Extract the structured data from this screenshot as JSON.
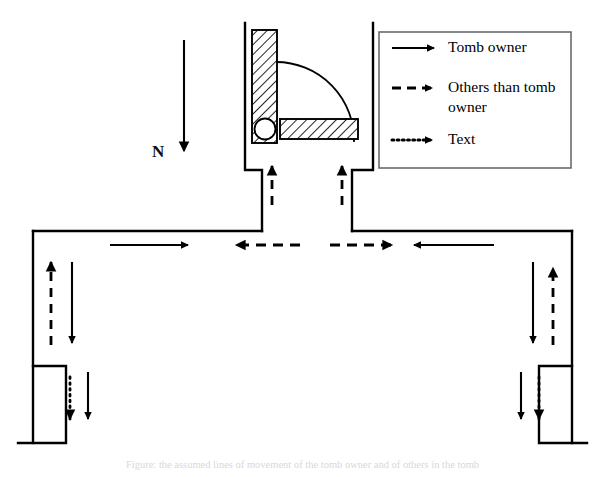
{
  "figure": {
    "background_color": "#ffffff",
    "line_color": "#000000",
    "caption": "Figure: the assumed lines of movement of the tomb owner and of others in the tomb"
  },
  "compass": {
    "label": "N",
    "direction": "down",
    "arrow_name": "north-arrow"
  },
  "legend": {
    "box_color": "#6b6b6b",
    "items": [
      {
        "id": "tomb-owner",
        "label": "Tomb owner",
        "line_style": "solid",
        "marker": "arrow-right"
      },
      {
        "id": "others-than-tomb-owner",
        "label": "Others than tomb owner",
        "label_line_1": "Others than tomb",
        "label_line_2": "owner",
        "line_style": "dashed",
        "marker": "arrow-right"
      },
      {
        "id": "text",
        "label": "Text",
        "line_style": "dotted",
        "marker": "arrow-right"
      }
    ]
  },
  "plan": {
    "shrine": {
      "name": "hatched-shrine-block",
      "fill": "hatch",
      "elements": [
        "vertical-jamb",
        "horizontal-lintel",
        "round-pivot",
        "door-swing-arc"
      ]
    },
    "chambers": [
      {
        "id": "left-chamber",
        "side": "left"
      },
      {
        "id": "right-chamber",
        "side": "right"
      }
    ]
  },
  "movement_arrows": [
    {
      "id": "shaft-left-dashed-up",
      "style": "dashed",
      "direction": "up",
      "actor": "others-than-tomb-owner"
    },
    {
      "id": "shaft-right-dashed-up",
      "style": "dashed",
      "direction": "up",
      "actor": "others-than-tomb-owner"
    },
    {
      "id": "corridor-left-solid-right",
      "style": "solid",
      "direction": "right",
      "actor": "tomb-owner"
    },
    {
      "id": "corridor-mid-left-dashed-left",
      "style": "dashed",
      "direction": "left",
      "actor": "others-than-tomb-owner"
    },
    {
      "id": "corridor-mid-right-dashed-right",
      "style": "dashed",
      "direction": "right",
      "actor": "others-than-tomb-owner"
    },
    {
      "id": "corridor-right-solid-left",
      "style": "solid",
      "direction": "left",
      "actor": "tomb-owner"
    },
    {
      "id": "left-wing-dashed-up",
      "style": "dashed",
      "direction": "up",
      "actor": "others-than-tomb-owner"
    },
    {
      "id": "left-wing-solid-down",
      "style": "solid",
      "direction": "down",
      "actor": "tomb-owner"
    },
    {
      "id": "left-chamber-dotted-down",
      "style": "dotted",
      "direction": "down",
      "actor": "text"
    },
    {
      "id": "left-chamber-solid-down",
      "style": "solid",
      "direction": "down",
      "actor": "tomb-owner"
    },
    {
      "id": "right-wing-solid-down",
      "style": "solid",
      "direction": "down",
      "actor": "tomb-owner"
    },
    {
      "id": "right-wing-dashed-up",
      "style": "dashed",
      "direction": "up",
      "actor": "others-than-tomb-owner"
    },
    {
      "id": "right-chamber-solid-down",
      "style": "solid",
      "direction": "down",
      "actor": "tomb-owner"
    },
    {
      "id": "right-chamber-dotted-down",
      "style": "dotted",
      "direction": "down",
      "actor": "text"
    }
  ]
}
